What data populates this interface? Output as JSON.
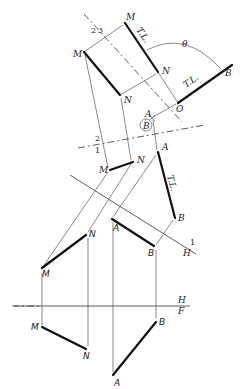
{
  "figure": {
    "labels": {
      "M": "M",
      "N": "N",
      "A": "A",
      "B": "B",
      "O": "O",
      "theta": "θ",
      "true_length": "T.L.",
      "fold_2": "2",
      "fold_3": "3",
      "fold_1": "1",
      "fold_H": "H",
      "fold_F": "F",
      "point_view_B": "B"
    },
    "views": {
      "front": {
        "M": [
          42,
          327
        ],
        "N": [
          88,
          351
        ],
        "A": [
          113,
          375
        ],
        "B": [
          157,
          322
        ]
      },
      "top": {
        "M": [
          42,
          270
        ],
        "N": [
          88,
          234
        ],
        "A": [
          113,
          219
        ],
        "B": [
          156,
          247
        ]
      },
      "aux1": {
        "M": [
          110,
          170
        ],
        "N": [
          133,
          162
        ],
        "A": [
          158,
          152
        ],
        "B": [
          175,
          218
        ]
      },
      "aux2": {
        "M": [
          84,
          52
        ],
        "N": [
          120,
          95
        ],
        "A": [
          153,
          117
        ]
      },
      "aux3": {
        "M": [
          125,
          23
        ],
        "N": [
          158,
          72
        ],
        "O": [
          178,
          103
        ],
        "B": [
          232,
          65
        ]
      }
    }
  }
}
